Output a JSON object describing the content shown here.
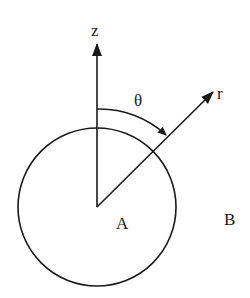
{
  "diagram": {
    "title": "",
    "labels": {
      "z_axis": "z",
      "r_axis": "r",
      "angle": "θ",
      "inside_region": "A",
      "outside_region": "B"
    },
    "colors": {
      "stroke": "#1a1a1a",
      "background": "#ffffff"
    },
    "geometry": {
      "circle": {
        "cx": 97,
        "cy": 207,
        "r": 79
      },
      "origin": {
        "x": 97,
        "y": 207
      },
      "z_axis_tip": {
        "x": 97,
        "y": 43
      },
      "r_axis_tip": {
        "x": 213,
        "y": 92
      },
      "angle_arc": {
        "from": "z-axis",
        "to": "r-axis",
        "direction": "clockwise"
      }
    }
  }
}
